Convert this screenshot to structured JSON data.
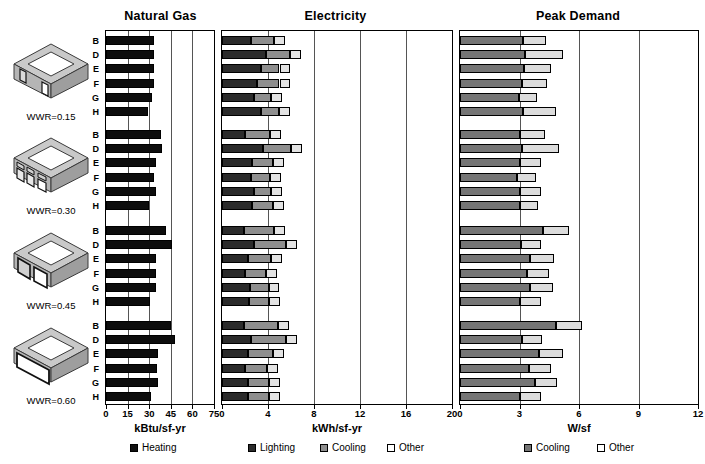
{
  "figure": {
    "top_caption": "",
    "background": "#ffffff"
  },
  "panels": [
    {
      "key": "natural_gas",
      "title": "Natural Gas",
      "axis_title": "kBtu/sf-yr",
      "ticks": [
        "0",
        "15",
        "30",
        "45",
        "60",
        "75"
      ],
      "max": 75
    },
    {
      "key": "electricity",
      "title": "Electricity",
      "axis_title": "kWh/sf-yr",
      "ticks": [
        "0",
        "4",
        "8",
        "12",
        "16",
        "20"
      ],
      "max": 20
    },
    {
      "key": "peak_demand",
      "title": "Peak Demand",
      "axis_title": "W/sf",
      "ticks": [
        "0",
        "3",
        "6",
        "9",
        "12"
      ],
      "max": 12
    }
  ],
  "groups": [
    {
      "label": "WWR=0.15",
      "icon": "building-isometric-wwr-015"
    },
    {
      "label": "WWR=0.30",
      "icon": "building-isometric-wwr-030"
    },
    {
      "label": "WWR=0.45",
      "icon": "building-isometric-wwr-045"
    },
    {
      "label": "WWR=0.60",
      "icon": "building-isometric-wwr-060"
    }
  ],
  "series_labels": [
    "B",
    "D",
    "E",
    "F",
    "G",
    "H"
  ],
  "legends": {
    "natural_gas": [
      {
        "label": "Heating",
        "color": "#111111",
        "swatch": "sw-heat"
      }
    ],
    "electricity": [
      {
        "label": "Lighting",
        "color": "#2b2b2b",
        "swatch": "sw-light"
      },
      {
        "label": "Cooling",
        "color": "#8e8e8e",
        "swatch": "sw-cool"
      },
      {
        "label": "Other",
        "color": "#ffffff",
        "swatch": "sw-other"
      }
    ],
    "peak_demand": [
      {
        "label": "Cooling",
        "color": "#757575",
        "swatch": "sw-pcool"
      },
      {
        "label": "Other",
        "color": "#ffffff",
        "swatch": "sw-pother"
      }
    ]
  },
  "chart_data": {
    "type": "bar",
    "orientation": "horizontal",
    "grouping": "4 window-to-wall-ratio cases x 6 building variants (B, D, E, F, G, H)",
    "categories": [
      "B",
      "D",
      "E",
      "F",
      "G",
      "H"
    ],
    "group_labels": [
      "WWR=0.15",
      "WWR=0.30",
      "WWR=0.45",
      "WWR=0.60"
    ],
    "panels": [
      {
        "name": "Natural Gas",
        "xlabel": "kBtu/sf-yr",
        "xlim": [
          0,
          75
        ],
        "xticks": [
          0,
          15,
          30,
          45,
          60,
          75
        ],
        "grid": true,
        "stacked": false,
        "series": [
          {
            "name": "Heating",
            "color": "#111111",
            "values_by_group": {
              "WWR=0.15": [
                33.5,
                33.0,
                33.5,
                33.0,
                32.0,
                29.5
              ],
              "WWR=0.30": [
                38.0,
                39.0,
                34.5,
                33.0,
                34.5,
                30.0
              ],
              "WWR=0.45": [
                42.0,
                45.5,
                35.0,
                34.5,
                34.5,
                30.5
              ],
              "WWR=0.60": [
                45.0,
                48.0,
                36.0,
                35.5,
                36.0,
                31.0
              ]
            }
          }
        ]
      },
      {
        "name": "Electricity",
        "xlabel": "kWh/sf-yr",
        "xlim": [
          0,
          20
        ],
        "xticks": [
          0,
          4,
          8,
          12,
          16,
          20
        ],
        "grid": true,
        "stacked": true,
        "series": [
          {
            "name": "Lighting",
            "color": "#2b2b2b",
            "values_by_group": {
              "WWR=0.15": [
                2.55,
                3.85,
                3.35,
                3.05,
                2.8,
                3.4
              ],
              "WWR=0.30": [
                2.0,
                3.55,
                2.6,
                2.55,
                2.75,
                2.65
              ],
              "WWR=0.45": [
                1.95,
                2.8,
                2.25,
                2.0,
                2.45,
                2.35
              ],
              "WWR=0.60": [
                1.95,
                2.55,
                2.25,
                2.0,
                2.3,
                2.25
              ]
            }
          },
          {
            "name": "Cooling",
            "color": "#8e8e8e",
            "values_by_group": {
              "WWR=0.15": [
                1.95,
                2.05,
                1.65,
                1.95,
                1.45,
                1.55
              ],
              "WWR=0.30": [
                2.2,
                2.45,
                1.8,
                1.6,
                1.5,
                1.75
              ],
              "WWR=0.45": [
                2.55,
                2.75,
                2.05,
                1.85,
                1.6,
                1.75
              ],
              "WWR=0.60": [
                2.95,
                3.05,
                2.15,
                1.95,
                1.8,
                1.85
              ]
            }
          },
          {
            "name": "Other",
            "color": "#ffffff",
            "values_by_group": {
              "WWR=0.15": [
                0.95,
                0.95,
                0.95,
                0.95,
                0.95,
                0.95
              ],
              "WWR=0.30": [
                0.95,
                0.95,
                0.95,
                0.95,
                0.95,
                0.95
              ],
              "WWR=0.45": [
                0.95,
                0.95,
                0.95,
                0.95,
                0.95,
                0.95
              ],
              "WWR=0.60": [
                0.95,
                0.95,
                0.95,
                0.95,
                0.95,
                0.95
              ]
            }
          }
        ]
      },
      {
        "name": "Peak Demand",
        "xlabel": "W/sf",
        "xlim": [
          0,
          12
        ],
        "xticks": [
          0,
          3,
          6,
          9,
          12
        ],
        "grid": true,
        "stacked": true,
        "series": [
          {
            "name": "Cooling",
            "color": "#757575",
            "values_by_group": {
              "WWR=0.15": [
                3.2,
                3.3,
                3.25,
                3.15,
                2.95,
                3.2
              ],
              "WWR=0.30": [
                3.0,
                3.15,
                3.05,
                2.85,
                3.05,
                3.0
              ],
              "WWR=0.45": [
                4.2,
                3.1,
                3.55,
                3.4,
                3.55,
                3.05
              ],
              "WWR=0.60": [
                4.85,
                3.15,
                4.0,
                3.5,
                3.8,
                3.05
              ]
            }
          },
          {
            "name": "Other",
            "color": "#ffffff",
            "values_by_group": {
              "WWR=0.15": [
                1.15,
                1.9,
                1.35,
                1.25,
                0.95,
                1.65
              ],
              "WWR=0.30": [
                1.3,
                1.85,
                1.05,
                1.0,
                1.05,
                0.95
              ],
              "WWR=0.45": [
                1.3,
                1.0,
                1.2,
                1.1,
                1.15,
                1.05
              ],
              "WWR=0.60": [
                1.3,
                1.0,
                1.2,
                1.1,
                1.1,
                1.05
              ]
            }
          }
        ]
      }
    ]
  }
}
